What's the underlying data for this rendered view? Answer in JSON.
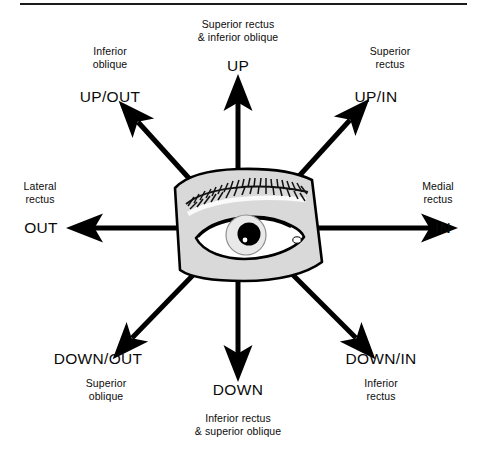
{
  "figure": {
    "divider": "horizontal-rule",
    "center_illustration": "eye-with-eyebrow",
    "colors": {
      "ink": "#000000",
      "rule": "#1b1b1b",
      "eye_fill": "#d9d9d9",
      "sclera_fill": "#ffffff",
      "iris_fill": "#e8e8e8",
      "pupil_fill": "#000000",
      "highlight": "#ffffff",
      "background": "#ffffff"
    }
  },
  "directions": [
    {
      "key": "up",
      "direction_label": "UP",
      "muscle_label": "Superior rectus\n& inferior oblique",
      "arrow": "arrow-up"
    },
    {
      "key": "up_out",
      "direction_label": "UP/OUT",
      "muscle_label": "Inferior\noblique",
      "arrow": "arrow-up-left"
    },
    {
      "key": "up_in",
      "direction_label": "UP/IN",
      "muscle_label": "Superior\nrectus",
      "arrow": "arrow-up-right"
    },
    {
      "key": "out",
      "direction_label": "OUT",
      "muscle_label": "Lateral\nrectus",
      "arrow": "arrow-left"
    },
    {
      "key": "in",
      "direction_label": "IN",
      "muscle_label": "Medial\nrectus",
      "arrow": "arrow-right"
    },
    {
      "key": "down_out",
      "direction_label": "DOWN/OUT",
      "muscle_label": "Superior\noblique",
      "arrow": "arrow-down-left"
    },
    {
      "key": "down_in",
      "direction_label": "DOWN/IN",
      "muscle_label": "Inferior\nrectus",
      "arrow": "arrow-down-right"
    },
    {
      "key": "down",
      "direction_label": "DOWN",
      "muscle_label": "Inferior rectus\n& superior oblique",
      "arrow": "arrow-down"
    }
  ]
}
